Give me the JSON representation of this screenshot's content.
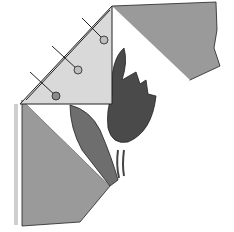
{
  "illustration": {
    "subject": "quilt block with tulip applique and pinned fabric triangle",
    "colors": {
      "background": "#ffffff",
      "light_fabric": "#d9d9d9",
      "mid_fabric": "#9a9a9a",
      "stem": "#6e6e6e",
      "tulip": "#4a4a4a",
      "outline": "#222222",
      "pin_head": "#8a8a8a"
    }
  }
}
